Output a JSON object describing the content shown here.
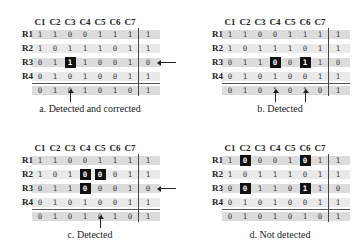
{
  "column_headers": [
    "C1",
    "C2",
    "C3",
    "C4",
    "C5",
    "C6",
    "C7"
  ],
  "row_labels": [
    "R1",
    "R2",
    "R3",
    "R4"
  ],
  "colors": {
    "row_band": "#dcdcdc",
    "row_band_alt": "#e9e9e9",
    "highlight": "#111111",
    "text": "#444444"
  },
  "panels": [
    {
      "id": "a",
      "caption": "a. Detected and corrected",
      "rows": [
        [
          "1",
          "1",
          "0",
          "0",
          "1",
          "1",
          "1",
          "1"
        ],
        [
          "1",
          "0",
          "1",
          "1",
          "1",
          "0",
          "1",
          "1"
        ],
        [
          "0",
          "1",
          "1",
          "1",
          "0",
          "0",
          "1",
          "0"
        ],
        [
          "0",
          "1",
          "0",
          "1",
          "0",
          "0",
          "1",
          "1"
        ]
      ],
      "parity": [
        "0",
        "1",
        "0",
        "1",
        "0",
        "1",
        "0",
        "1"
      ],
      "highlighted": [
        [
          2,
          2
        ]
      ],
      "row_arrows": [
        2
      ],
      "col_arrows": [
        2
      ]
    },
    {
      "id": "b",
      "caption": "b. Detected",
      "rows": [
        [
          "1",
          "1",
          "0",
          "0",
          "1",
          "1",
          "1",
          "1"
        ],
        [
          "1",
          "0",
          "1",
          "1",
          "1",
          "0",
          "1",
          "1"
        ],
        [
          "0",
          "1",
          "1",
          "0",
          "0",
          "1",
          "1",
          "0"
        ],
        [
          "0",
          "1",
          "0",
          "1",
          "0",
          "0",
          "1",
          "1"
        ]
      ],
      "parity": [
        "0",
        "1",
        "0",
        "1",
        "0",
        "1",
        "0",
        "1"
      ],
      "highlighted": [
        [
          2,
          3
        ],
        [
          2,
          5
        ]
      ],
      "row_arrows": [],
      "col_arrows": [
        3,
        5
      ]
    },
    {
      "id": "c",
      "caption": "c. Detected",
      "rows": [
        [
          "1",
          "1",
          "0",
          "0",
          "1",
          "1",
          "1",
          "1"
        ],
        [
          "1",
          "0",
          "1",
          "0",
          "0",
          "0",
          "1",
          "1"
        ],
        [
          "0",
          "1",
          "1",
          "0",
          "0",
          "0",
          "1",
          "0"
        ],
        [
          "0",
          "1",
          "0",
          "1",
          "0",
          "0",
          "1",
          "1"
        ]
      ],
      "parity": [
        "0",
        "1",
        "0",
        "1",
        "0",
        "1",
        "0",
        "1"
      ],
      "highlighted": [
        [
          1,
          3
        ],
        [
          1,
          4
        ],
        [
          2,
          3
        ]
      ],
      "row_arrows": [
        2
      ],
      "col_arrows": [
        4
      ]
    },
    {
      "id": "d",
      "caption": "d. Not detected",
      "rows": [
        [
          "1",
          "0",
          "0",
          "0",
          "1",
          "0",
          "1",
          "1"
        ],
        [
          "1",
          "0",
          "1",
          "1",
          "1",
          "0",
          "1",
          "1"
        ],
        [
          "0",
          "0",
          "1",
          "1",
          "0",
          "1",
          "1",
          "0"
        ],
        [
          "0",
          "1",
          "0",
          "1",
          "0",
          "0",
          "1",
          "1"
        ]
      ],
      "parity": [
        "0",
        "1",
        "0",
        "1",
        "0",
        "1",
        "0",
        "1"
      ],
      "highlighted": [
        [
          0,
          1
        ],
        [
          0,
          5
        ],
        [
          2,
          1
        ],
        [
          2,
          5
        ]
      ],
      "row_arrows": [],
      "col_arrows": []
    }
  ]
}
